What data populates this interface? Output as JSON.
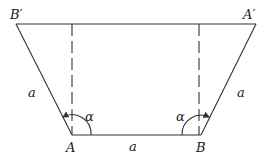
{
  "diagram": {
    "points": {
      "B_prime": {
        "label": "B′",
        "x": 16,
        "y": 24
      },
      "A_prime": {
        "label": "A′",
        "x": 256,
        "y": 24
      },
      "A": {
        "label": "A",
        "x": 72,
        "y": 135
      },
      "B": {
        "label": "B",
        "x": 201,
        "y": 135
      }
    },
    "side_labels": {
      "left": "a",
      "right": "a",
      "bottom": "a"
    },
    "angle_label": "α",
    "stroke_color": "#333333"
  }
}
